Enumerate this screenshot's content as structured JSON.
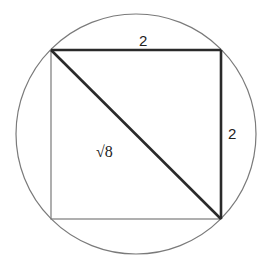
{
  "diagram": {
    "title": "",
    "shapes": {
      "circle": {
        "cx": 136,
        "cy": 134,
        "r": 120,
        "stroke": "#777777"
      },
      "square": {
        "x1": 51,
        "y1": 50,
        "x2": 221,
        "y2": 219,
        "stroke": "#777777"
      },
      "bold_edges": {
        "top": {
          "from": [
            51,
            50
          ],
          "to": [
            221,
            50
          ]
        },
        "right": {
          "from": [
            221,
            50
          ],
          "to": [
            221,
            219
          ]
        },
        "diagonal": {
          "from": [
            51,
            50
          ],
          "to": [
            221,
            219
          ]
        },
        "stroke": "#2a2a2a"
      }
    },
    "labels": {
      "top_side": "2",
      "right_side": "2",
      "diagonal": "√8"
    }
  }
}
